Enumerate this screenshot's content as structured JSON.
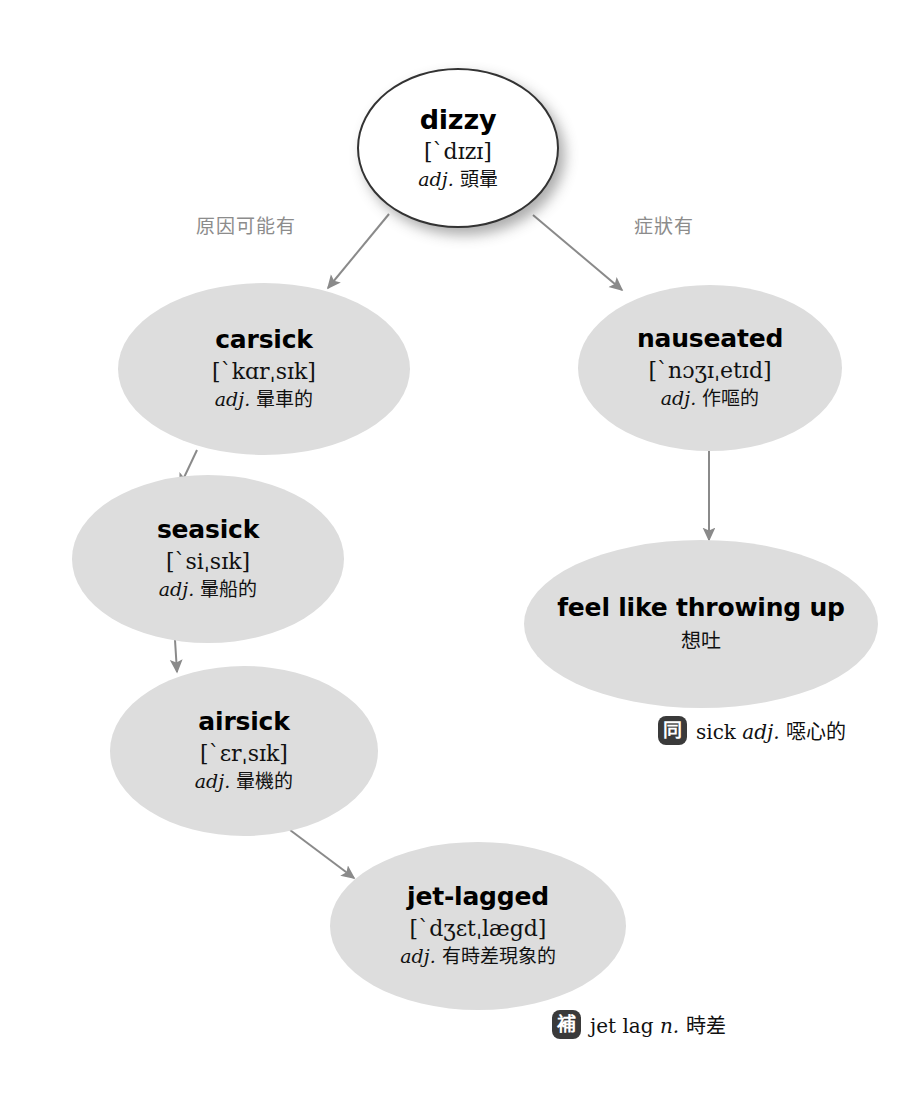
{
  "diagram": {
    "type": "word-map",
    "root": {
      "id": "dizzy",
      "term": "dizzy",
      "phonetic": "[`dɪzɪ]",
      "pos": "adj.",
      "gloss": "頭暈"
    },
    "edge_labels": {
      "cause": "原因可能有",
      "symptom": "症狀有"
    },
    "nodes": [
      {
        "id": "carsick",
        "term": "carsick",
        "phonetic": "[`kɑrˌsɪk]",
        "pos": "adj.",
        "gloss": "暈車的"
      },
      {
        "id": "seasick",
        "term": "seasick",
        "phonetic": "[`siˌsɪk]",
        "pos": "adj.",
        "gloss": "暈船的"
      },
      {
        "id": "airsick",
        "term": "airsick",
        "phonetic": "[`ɛrˌsɪk]",
        "pos": "adj.",
        "gloss": "暈機的"
      },
      {
        "id": "jet-lagged",
        "term": "jet-lagged",
        "phonetic": "[`dʒɛtˌlægd]",
        "pos": "adj.",
        "gloss": "有時差現象的"
      },
      {
        "id": "nauseated",
        "term": "nauseated",
        "phonetic": "[`nɔʒɪˌetɪd]",
        "pos": "adj.",
        "gloss": "作嘔的"
      },
      {
        "id": "feel-like-throwing-up",
        "term": "feel like throwing up",
        "phonetic": "",
        "pos": "",
        "gloss": "想吐"
      }
    ],
    "annotations": [
      {
        "id": "sick",
        "badge": "同",
        "badge_meaning": "synonym",
        "text": "sick",
        "pos": "adj.",
        "gloss": "噁心的"
      },
      {
        "id": "jet-lag",
        "badge": "補",
        "badge_meaning": "supplement",
        "text": "jet lag",
        "pos": "n.",
        "gloss": "時差"
      }
    ],
    "edges": [
      {
        "from": "dizzy",
        "to": "carsick",
        "label": "原因可能有"
      },
      {
        "from": "dizzy",
        "to": "nauseated",
        "label": "症狀有"
      },
      {
        "from": "carsick",
        "to": "seasick",
        "label": ""
      },
      {
        "from": "seasick",
        "to": "airsick",
        "label": ""
      },
      {
        "from": "airsick",
        "to": "jet-lagged",
        "label": ""
      },
      {
        "from": "nauseated",
        "to": "feel-like-throwing-up",
        "label": ""
      }
    ],
    "colors": {
      "node_fill": "#dddddd",
      "root_fill": "#ffffff",
      "root_stroke": "#333333",
      "arrow": "#8a8a8a",
      "edge_label": "#8c8c8c",
      "badge": "#3a3a3a",
      "text": "#111111",
      "background": "#ffffff"
    }
  }
}
